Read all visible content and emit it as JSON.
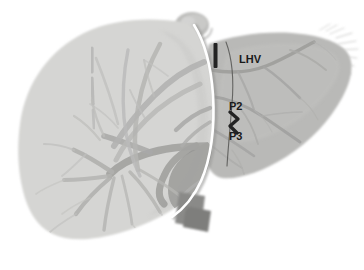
{
  "figure": {
    "kind": "anatomical-illustration",
    "background_color": "#ffffff",
    "width": 364,
    "height": 270
  },
  "palette": {
    "background": "#ffffff",
    "right_lobe_fill": "#d5d5d3",
    "right_lobe_fill_dark": "#c9c9c7",
    "left_lobe_fill": "#b9b9b7",
    "left_lobe_fill_light": "#c2c2c0",
    "vessel_light": "#bcbcba",
    "vessel_mid": "#a9a9a7",
    "vessel_dark": "#9a9a98",
    "portal_trunk": "#8f8f8d",
    "ivc_inferior": "#7e7e7c",
    "ivc_superior": "#bdbdbb",
    "ivc_superior_shadow": "#9d9d9b",
    "demarcation_line": "#ffffff",
    "demarcation_shadow": "#8c8c8a",
    "marker_black": "#232323",
    "label_text": "#1a1a1a",
    "feather_edge": "#c4c4c2"
  },
  "labels": [
    {
      "id": "lhv",
      "text": "LHV",
      "meaning": "left-hepatic-vein",
      "x": 239,
      "y": 54
    },
    {
      "id": "p2",
      "text": "P2",
      "meaning": "portal-branch-segment-2",
      "x": 229,
      "y": 101
    },
    {
      "id": "p3",
      "text": "P3",
      "meaning": "portal-branch-segment-3",
      "x": 229,
      "y": 131
    }
  ],
  "markers": [
    {
      "id": "vertical-bar-marker",
      "shape": "vertical-bar",
      "color": "#232323",
      "x": 214,
      "y": 44,
      "width": 4,
      "height": 24
    },
    {
      "id": "zigzag-marker",
      "shape": "zigzag-segment-marker",
      "color": "#232323",
      "from_label": "P2",
      "to_label": "P3"
    }
  ],
  "structures": [
    {
      "id": "right-lobe",
      "name": "right-hepatic-lobe",
      "tone": "light-gray"
    },
    {
      "id": "left-lobe",
      "name": "left-hepatic-lobe",
      "tone": "mid-gray"
    },
    {
      "id": "demarcation",
      "name": "interlobar-demarcation-line",
      "tone": "white-highlight"
    },
    {
      "id": "ivc-superior",
      "name": "suprahepatic-inferior-vena-cava",
      "tone": "light-gray-rounded"
    },
    {
      "id": "ivc-inferior",
      "name": "infrahepatic-inferior-vena-cava",
      "tone": "dark-gray-rectangle"
    },
    {
      "id": "portal-tree",
      "name": "portal-venous-branching-tree",
      "tone": "mid-gray"
    },
    {
      "id": "hepatic-veins-left",
      "name": "left-lobe-hepatic-vein-branches",
      "tone": "dark-gray"
    }
  ]
}
